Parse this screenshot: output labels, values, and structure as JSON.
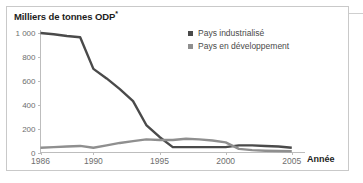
{
  "chart_data": {
    "type": "line",
    "title": "Milliers de tonnes ODP*",
    "title_text": "Milliers de tonnes ODP",
    "title_superscript": "*",
    "xlabel": "Année",
    "ylabel": "Milliers de tonnes ODP",
    "xlim": [
      1986,
      2006
    ],
    "ylim": [
      0,
      1000
    ],
    "grid": false,
    "legend_position": "top-right",
    "x_tick_labels": [
      "1986",
      "1990",
      "1995",
      "2000",
      "2005"
    ],
    "x_tick_values": [
      1986,
      1990,
      1995,
      2000,
      2005
    ],
    "y_tick_labels": [
      "0",
      "200",
      "400",
      "600",
      "800",
      "1 000"
    ],
    "y_tick_values": [
      0,
      200,
      400,
      600,
      800,
      1000
    ],
    "x": [
      1986,
      1987,
      1988,
      1989,
      1990,
      1991,
      1992,
      1993,
      1994,
      1995,
      1996,
      1997,
      1998,
      1999,
      2000,
      2001,
      2002,
      2003,
      2004,
      2005
    ],
    "series": [
      {
        "name": "Pays industrialisé",
        "color": "#4a4a4a",
        "values": [
          1000,
          990,
          975,
          965,
          700,
          620,
          530,
          430,
          230,
          130,
          45,
          45,
          45,
          45,
          45,
          60,
          60,
          55,
          50,
          40
        ]
      },
      {
        "name": "Pays en développement",
        "color": "#8f8f8f",
        "values": [
          40,
          45,
          50,
          55,
          40,
          60,
          80,
          95,
          110,
          105,
          105,
          115,
          110,
          100,
          85,
          30,
          20,
          15,
          12,
          10
        ]
      }
    ]
  },
  "legend": {
    "items": [
      {
        "label": "Pays industrialisé",
        "color": "#4a4a4a"
      },
      {
        "label": "Pays en développement",
        "color": "#8f8f8f"
      }
    ]
  },
  "axis": {
    "x_title": "Année"
  }
}
